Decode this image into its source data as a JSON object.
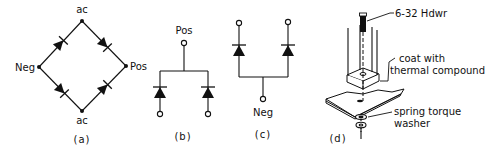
{
  "figure": {
    "panels": [
      {
        "id": "a",
        "caption": "(a)",
        "description": "Full-wave diode bridge rectifier",
        "labels": {
          "top": "ac",
          "bottom": "ac",
          "left": "Neg",
          "right": "Pos"
        }
      },
      {
        "id": "b",
        "caption": "(b)",
        "description": "Common-cathode diode pair",
        "labels": {
          "top": "Pos"
        }
      },
      {
        "id": "c",
        "caption": "(c)",
        "description": "Common-anode diode pair",
        "labels": {
          "bottom": "Neg"
        }
      },
      {
        "id": "d",
        "caption": "(d)",
        "description": "Bridge mounting hardware assembly",
        "callouts": [
          {
            "line1": "6-32 Hdwr",
            "line2": ""
          },
          {
            "line1": "coat with",
            "line2": "thermal compound"
          },
          {
            "line1": "spring torque",
            "line2": "washer"
          }
        ]
      }
    ]
  },
  "colors": {
    "ink": "#111111",
    "background": "#ffffff"
  }
}
